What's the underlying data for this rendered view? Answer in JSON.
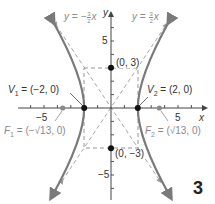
{
  "figure": {
    "number": "3",
    "equation_described": "x^2/4 - y^2/9 = 1",
    "axes": {
      "x_label": "x",
      "y_label": "y",
      "x_tick_labels": [
        {
          "value": -5,
          "text": "−5"
        },
        {
          "value": 5,
          "text": "5"
        }
      ],
      "y_tick_labels": [
        {
          "value": 5,
          "text": "5"
        },
        {
          "value": -5,
          "text": "−5"
        }
      ],
      "x_range": [
        -7,
        7
      ],
      "y_range": [
        -7,
        7
      ]
    },
    "asymptotes": [
      {
        "label_prefix": "y = −",
        "frac_num": "3",
        "frac_den": "2",
        "label_suffix": "x",
        "slope": -1.5
      },
      {
        "label_prefix": "y = ",
        "frac_num": "3",
        "frac_den": "2",
        "label_suffix": "x",
        "slope": 1.5
      }
    ],
    "points": {
      "v1": {
        "label": "V₁ = (−2, 0)",
        "sub_name": "V",
        "sub": "1",
        "rest": " = (−2, 0)",
        "x": -2,
        "y": 0
      },
      "v2": {
        "label": "V₂ = (2, 0)",
        "sub_name": "V",
        "sub": "2",
        "rest": " = (2, 0)",
        "x": 2,
        "y": 0
      },
      "f1": {
        "label": "F₁ = (−√13, 0)",
        "sub_name": "F",
        "sub": "1",
        "rest": " = (−√13, 0)",
        "x": -3.606,
        "y": 0
      },
      "f2": {
        "label": "F₂ = (√13, 0)",
        "sub_name": "F",
        "sub": "2",
        "rest": " = (√13, 0)",
        "x": 3.606,
        "y": 0
      },
      "b1": {
        "label": "(0, 3)",
        "x": 0,
        "y": 3
      },
      "b2": {
        "label": "(0, −3)",
        "x": 0,
        "y": -3
      }
    },
    "colors": {
      "curve": "#7a7a7a",
      "axis": "#444444",
      "dashed": "#9a9a9a",
      "point": "#111111",
      "focus": "#8a8a8a"
    }
  }
}
